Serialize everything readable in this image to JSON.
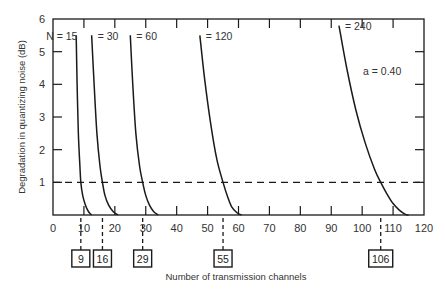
{
  "chart_data": {
    "type": "line",
    "title": "",
    "xlabel": "Number of transmission channels",
    "ylabel": "Degradation in quantizing noise (dB)",
    "xlim": [
      0,
      120
    ],
    "ylim": [
      0,
      6
    ],
    "x_ticks": [
      0,
      10,
      20,
      30,
      40,
      50,
      60,
      70,
      80,
      90,
      100,
      110,
      120
    ],
    "y_ticks": [
      1,
      2,
      3,
      4,
      5,
      6
    ],
    "grid": false,
    "annotation": "a = 0.40",
    "threshold_line": {
      "y": 1,
      "style": "dashed"
    },
    "series": [
      {
        "name": "N = 15",
        "label": "N = 15",
        "crossing_at_1dB": 9,
        "points": [
          [
            7.5,
            5.5
          ],
          [
            7.8,
            4.0
          ],
          [
            8.2,
            2.5
          ],
          [
            8.7,
            1.5
          ],
          [
            9,
            1.0
          ],
          [
            9.6,
            0.6
          ],
          [
            10.5,
            0.3
          ],
          [
            11.5,
            0.1
          ],
          [
            12.5,
            0.0
          ]
        ]
      },
      {
        "name": "N = 30",
        "label": "= 30",
        "crossing_at_1dB": 16,
        "points": [
          [
            12.5,
            5.5
          ],
          [
            13.3,
            4.0
          ],
          [
            14.2,
            2.5
          ],
          [
            15.2,
            1.5
          ],
          [
            16,
            1.0
          ],
          [
            16.8,
            0.6
          ],
          [
            18,
            0.3
          ],
          [
            19.5,
            0.1
          ],
          [
            21,
            0.0
          ]
        ]
      },
      {
        "name": "N = 60",
        "label": "= 60",
        "crossing_at_1dB": 29,
        "points": [
          [
            25,
            5.5
          ],
          [
            25.8,
            4.0
          ],
          [
            26.8,
            2.5
          ],
          [
            28,
            1.5
          ],
          [
            29,
            1.0
          ],
          [
            30,
            0.6
          ],
          [
            31.2,
            0.3
          ],
          [
            32.6,
            0.1
          ],
          [
            34,
            0.0
          ]
        ]
      },
      {
        "name": "N = 120",
        "label": "= 120",
        "crossing_at_1dB": 55,
        "points": [
          [
            47.5,
            5.5
          ],
          [
            49,
            4.2
          ],
          [
            51,
            2.8
          ],
          [
            53,
            1.7
          ],
          [
            55,
            1.0
          ],
          [
            56.5,
            0.55
          ],
          [
            57.8,
            0.25
          ],
          [
            59.5,
            0.07
          ],
          [
            61,
            0.0
          ]
        ]
      },
      {
        "name": "N = 240",
        "label": "= 240",
        "crossing_at_1dB": 106,
        "points": [
          [
            92.5,
            5.8
          ],
          [
            95,
            4.5
          ],
          [
            98,
            3.2
          ],
          [
            101,
            2.2
          ],
          [
            104,
            1.4
          ],
          [
            106,
            1.0
          ],
          [
            108,
            0.65
          ],
          [
            110,
            0.35
          ],
          [
            112,
            0.15
          ],
          [
            114,
            0.02
          ],
          [
            115,
            0.0
          ]
        ]
      }
    ],
    "boxed_values": [
      9,
      16,
      29,
      55,
      106
    ]
  },
  "labels": {
    "ylabel": "Degradation in quantizing noise (dB)",
    "xlabel": "Number of transmission channels",
    "annotation": "a = 0.40"
  }
}
